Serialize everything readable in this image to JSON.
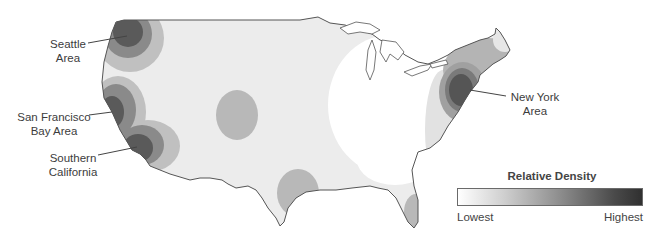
{
  "map": {
    "region": "Contiguous United States",
    "type": "density heat map",
    "colors": {
      "outline": "#555555",
      "base_fill": "#eeeeee",
      "level_1": "#d8d8d8",
      "level_2": "#b4b4b4",
      "level_3": "#8a8a8a",
      "level_4": "#555555"
    },
    "callouts": [
      {
        "id": "seattle",
        "line1": "Seattle",
        "line2": "Area"
      },
      {
        "id": "sf",
        "line1": "San Francisco",
        "line2": "Bay Area"
      },
      {
        "id": "socal",
        "line1": "Southern",
        "line2": "California"
      },
      {
        "id": "ny",
        "line1": "New York",
        "line2": "Area"
      }
    ]
  },
  "legend": {
    "title": "Relative Density",
    "low_label": "Lowest",
    "high_label": "Highest",
    "gradient_start": "#ffffff",
    "gradient_end": "#303030"
  }
}
